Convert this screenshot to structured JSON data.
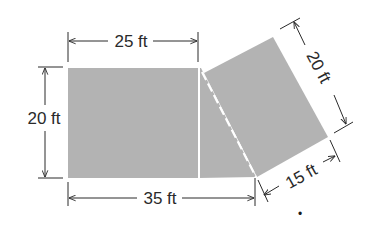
{
  "diagram": {
    "type": "floor-plan-area",
    "colors": {
      "fill": "#b3b3b3",
      "line": "#2a2a2a",
      "divider": "#ffffff",
      "background": "#ffffff"
    },
    "shapes": [
      {
        "name": "rectangle",
        "description": "Left rectangular region"
      },
      {
        "name": "rotated-rectangle",
        "description": "Right tilted region, 20 ft by 15 ft"
      },
      {
        "name": "triangle-gap",
        "description": "Triangular region between rectangle and tilted region, bounded by solid and dashed white lines"
      }
    ],
    "dimensions": {
      "top_width": "25 ft",
      "left_height": "20 ft",
      "bottom_width": "35 ft",
      "tilted_long_side": "20 ft",
      "tilted_short_side": "15 ft"
    },
    "stray_mark": "•"
  }
}
